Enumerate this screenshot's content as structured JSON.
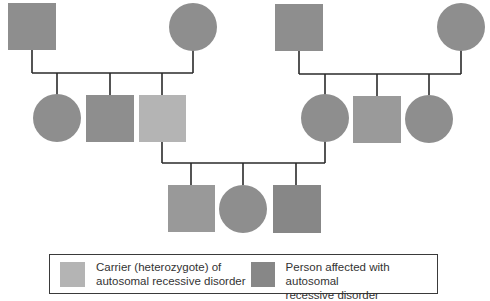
{
  "colors": {
    "affected": "#8e8e8e",
    "carrier": "#b4b4b4",
    "affected_dark": "#878787",
    "line": "#2a2a2a",
    "legend_border": "#3a3a3a",
    "text": "#333333"
  },
  "pedigree": {
    "generations": [
      {
        "id": "I",
        "families": [
          {
            "side": "left",
            "members": [
              {
                "sex": "male",
                "status": "affected"
              },
              {
                "sex": "female",
                "status": "affected"
              }
            ]
          },
          {
            "side": "right",
            "members": [
              {
                "sex": "male",
                "status": "affected"
              },
              {
                "sex": "female",
                "status": "affected"
              }
            ]
          }
        ]
      },
      {
        "id": "II",
        "sibships": [
          {
            "side": "left",
            "members": [
              {
                "sex": "female",
                "status": "affected"
              },
              {
                "sex": "male",
                "status": "affected"
              },
              {
                "sex": "male",
                "status": "carrier"
              }
            ]
          },
          {
            "side": "right",
            "members": [
              {
                "sex": "female",
                "status": "affected"
              },
              {
                "sex": "male",
                "status": "affected"
              },
              {
                "sex": "female",
                "status": "affected"
              }
            ]
          }
        ]
      },
      {
        "id": "III",
        "sibships": [
          {
            "members": [
              {
                "sex": "male",
                "status": "affected"
              },
              {
                "sex": "female",
                "status": "affected"
              },
              {
                "sex": "male",
                "status": "affected"
              }
            ]
          }
        ]
      }
    ]
  },
  "legend": {
    "carrier": {
      "label": "Carrier (heterozygote) of\nautosomal recessive disorder"
    },
    "affected": {
      "label": "Person affected with autosomal\nrecessive disorder"
    }
  }
}
